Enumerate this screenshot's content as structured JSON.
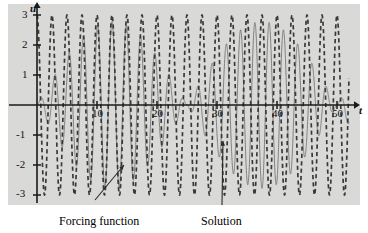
{
  "figure": {
    "background_color": "#d9d9d8",
    "page_color": "#ffffff",
    "axis_color": "#1a1a1a",
    "forcing_color": "#3a3a3a",
    "solution_color": "#6e6e6e"
  },
  "axes": {
    "y_axis_name": "u",
    "x_axis_name": "t",
    "y_ticks": [
      "3",
      "2",
      "1",
      "-1",
      "-2",
      "-3"
    ],
    "y_tick_values": [
      3,
      2,
      1,
      -1,
      -2,
      -3
    ],
    "x_ticks": [
      "10",
      "20",
      "30",
      "40",
      "50"
    ],
    "x_tick_values": [
      10,
      20,
      30,
      40,
      50
    ]
  },
  "annotations": {
    "forcing_label": "Forcing function",
    "solution_label": "Solution"
  },
  "chart_data": {
    "type": "line",
    "title": "",
    "xlabel": "t",
    "ylabel": "u",
    "xlim": [
      0,
      52
    ],
    "ylim": [
      -3.4,
      3.4
    ],
    "grid": false,
    "legend": "annotated-arrows",
    "series": [
      {
        "name": "Forcing function",
        "style": "dashed",
        "color": "#3a3a3a",
        "amplitude": 3.0,
        "angular_frequency": 2.5133,
        "period": 2.5,
        "formula": "u = 3*cos(2.5133*t)",
        "peak_times": [
          0,
          2.5,
          5,
          7.5,
          10,
          12.5,
          15,
          17.5,
          20,
          22.5,
          25,
          27.5,
          30,
          32.5,
          35,
          37.5,
          40,
          42.5,
          45,
          47.5,
          50
        ],
        "peak_value": 3,
        "trough_value": -3
      },
      {
        "name": "Solution",
        "style": "solid",
        "color": "#6e6e6e",
        "formula": "u = 2.778*sin(0.1257*t)*sin(2.6389*t)",
        "envelope_amplitude": 2.78,
        "beat_period": 50,
        "carrier_period": 2.381,
        "envelope_peak_times": [
          12.5,
          37.5
        ],
        "envelope_peak_value": 2.78,
        "envelope_zero_times": [
          0,
          25,
          50
        ]
      }
    ],
    "annotations": [
      {
        "text": "Forcing function",
        "points_to": "Forcing function",
        "arrow": "diagonal-up-right",
        "tail_x": 95,
        "tail_y": 200,
        "head_t": 14.5,
        "head_u": -2.0
      },
      {
        "text": "Solution",
        "points_to": "Solution",
        "arrow": "vertical-up",
        "tail_x": 222,
        "tail_y": 205,
        "head_t": 31.0,
        "head_u": -1.2
      }
    ]
  }
}
